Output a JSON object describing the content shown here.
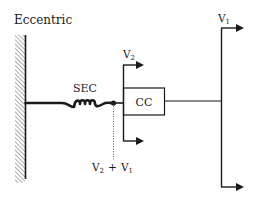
{
  "title": "Eccentric",
  "labels": {
    "spring": "SEC",
    "contractile": "CC",
    "v2": {
      "base": "V",
      "sub": "2"
    },
    "v1": {
      "base": "V",
      "sub": "1"
    },
    "sum": {
      "a_base": "V",
      "a_sub": "2",
      "op": "+",
      "b_base": "V",
      "b_sub": "1"
    }
  },
  "colors": {
    "stroke": "#1a1a1a",
    "hatch": "#555555",
    "background": "#ffffff"
  }
}
